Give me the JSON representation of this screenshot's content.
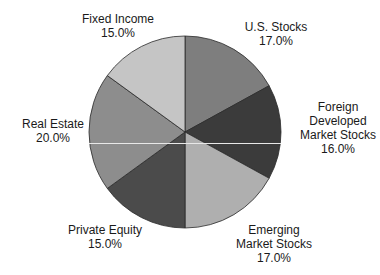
{
  "chart_data": {
    "type": "pie",
    "title": "",
    "start_angle_deg": 0,
    "direction": "clockwise",
    "slices": [
      {
        "label": "U.S. Stocks",
        "value": 17.0,
        "display": "17.0%",
        "color": "#7e7e7e"
      },
      {
        "label": "Foreign Developed Market Stocks",
        "value": 16.0,
        "display": "16.0%",
        "color": "#3b3b3b"
      },
      {
        "label": "Emerging Market Stocks",
        "value": 17.0,
        "display": "17.0%",
        "color": "#afafaf"
      },
      {
        "label": "Private Equity",
        "value": 15.0,
        "display": "15.0%",
        "color": "#4b4b4b"
      },
      {
        "label": "Real Estate",
        "value": 20.0,
        "display": "20.0%",
        "color": "#8d8d8d"
      },
      {
        "label": "Fixed Income",
        "value": 15.0,
        "display": "15.0%",
        "color": "#c5c5c5"
      }
    ],
    "legend": "none (labels placed outside slices)"
  },
  "labels": {
    "us": {
      "line1": "U.S. Stocks",
      "pct": "17.0%"
    },
    "foreign": {
      "line1": "Foreign",
      "line2": "Developed",
      "line3": "Market Stocks",
      "pct": "16.0%"
    },
    "emerging": {
      "line1": "Emerging",
      "line2": "Market Stocks",
      "pct": "17.0%"
    },
    "private": {
      "line1": "Private Equity",
      "pct": "15.0%"
    },
    "realestate": {
      "line1": "Real Estate",
      "pct": "20.0%"
    },
    "fixed": {
      "line1": "Fixed Income",
      "pct": "15.0%"
    }
  }
}
